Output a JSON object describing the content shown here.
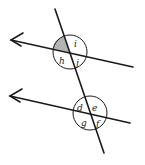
{
  "figure": {
    "shaded_angle_color": "#b3b3b3",
    "line_color": "#1a1a1a",
    "upper_intersection": {
      "labels": {
        "top_right": "i",
        "bottom_left": "h",
        "bottom_right": "j"
      },
      "shaded_angle": "top_left"
    },
    "lower_intersection": {
      "labels": {
        "top_left": "d",
        "top_right": "e",
        "bottom_left": "g",
        "bottom_right": "f"
      }
    }
  }
}
